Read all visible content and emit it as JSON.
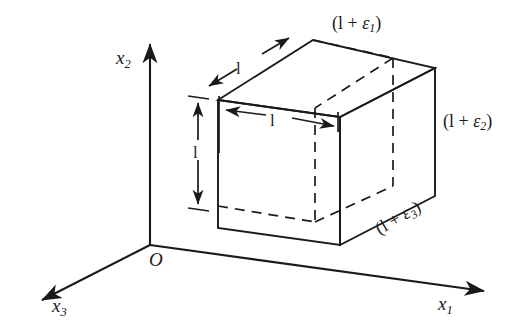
{
  "figure": {
    "kind": "strain-cube-diagram",
    "background_color": "#ffffff",
    "line_color": "#1a1a1a",
    "axes": {
      "origin_label": "O",
      "x1_label_base": "x",
      "x1_label_sub": "1",
      "x2_label_base": "x",
      "x2_label_sub": "2",
      "x3_label_base": "x",
      "x3_label_sub": "3"
    },
    "dimensions": [
      {
        "name": "depth",
        "label": "l"
      },
      {
        "name": "width",
        "label": "l"
      },
      {
        "name": "height",
        "label": "l"
      }
    ],
    "strain_labels": {
      "eps1_open": "(l + ",
      "eps1_sym": "ε",
      "eps1_sub": "1",
      "eps1_close": ")",
      "eps2_open": "(l + ",
      "eps2_sym": "ε",
      "eps2_sub": "2",
      "eps2_close": ")",
      "eps3_open": "(l + ",
      "eps3_sym": "ε",
      "eps3_sub": "3",
      "eps3_close": ")"
    }
  }
}
